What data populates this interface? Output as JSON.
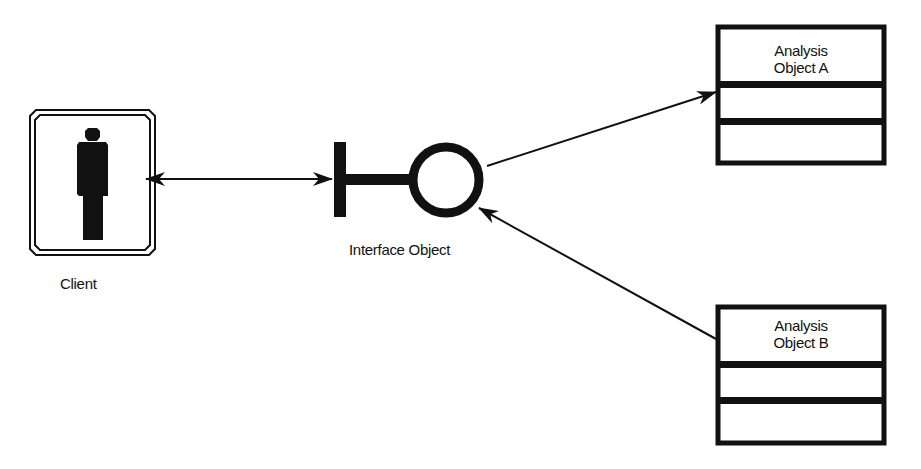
{
  "diagram": {
    "type": "UML robustness diagram",
    "nodes": [
      {
        "id": "client",
        "kind": "actor",
        "label": "Client"
      },
      {
        "id": "interface",
        "kind": "boundary-object",
        "label": "Interface Object"
      },
      {
        "id": "analysisA",
        "kind": "class-box",
        "title_line1": "Analysis",
        "title_line2": "Object A",
        "compartments": 3
      },
      {
        "id": "analysisB",
        "kind": "class-box",
        "title_line1": "Analysis",
        "title_line2": "Object B",
        "compartments": 3
      }
    ],
    "edges": [
      {
        "from": "client",
        "to": "interface",
        "direction": "bidirectional"
      },
      {
        "from": "interface",
        "to": "analysisA",
        "direction": "to-target"
      },
      {
        "from": "analysisB",
        "to": "interface",
        "direction": "to-target"
      }
    ]
  },
  "labels": {
    "client": "Client",
    "interface": "Interface Object",
    "boxA_line1": "Analysis",
    "boxA_line2": "Object A",
    "boxB_line1": "Analysis",
    "boxB_line2": "Object B"
  },
  "colors": {
    "stroke": "#111111",
    "background": "#ffffff"
  }
}
